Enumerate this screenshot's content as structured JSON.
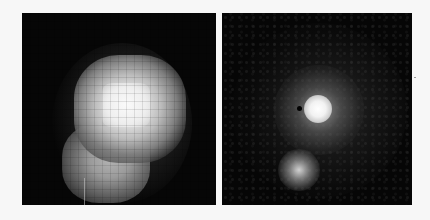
{
  "figure": {
    "type": "side-by-side astronomical image comparison",
    "background_color": "#f7f7f7",
    "panels": [
      {
        "id": "left",
        "description": "Low-resolution pixelated grayscale image of a bright extended source with a secondary lobe to the lower left",
        "background_color": "#060606",
        "features": [
          {
            "name": "bright-core",
            "approx_center": [
              118,
              105
            ],
            "color": "#f2f2f2"
          },
          {
            "name": "lower-left-lobe",
            "approx_center": [
              95,
              155
            ],
            "color": "#b5b5b5"
          }
        ]
      },
      {
        "id": "right",
        "description": "Higher-resolution grayscale image showing a compact bright nucleus, a fainter companion source below, and diffuse spiral-like haze",
        "background_color": "#060606",
        "features": [
          {
            "name": "bright-nucleus",
            "approx_center": [
              319,
              109
            ],
            "color": "#ffffff"
          },
          {
            "name": "companion-source",
            "approx_center": [
              298,
              165
            ],
            "color": "#dcdcdc"
          },
          {
            "name": "dark-speck",
            "approx_center": [
              299,
              107
            ],
            "color": "#020202"
          }
        ]
      }
    ]
  }
}
